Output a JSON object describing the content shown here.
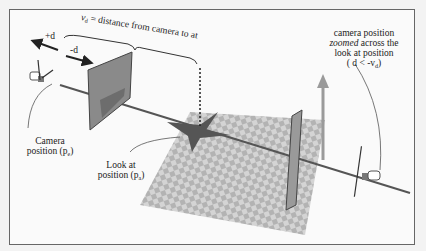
{
  "labels": {
    "distance_vd": "v",
    "distance_sub": "d",
    "distance_text": " = distance from camera to at",
    "plus_d": "+d",
    "minus_d": "-d",
    "camera_position_line1": "Camera",
    "camera_position_line2": "position (p",
    "camera_position_sub": "e",
    "look_at_line1": "Look at",
    "look_at_line2": "position (p",
    "look_at_sub": "a",
    "zoomed_line1": "camera position",
    "zoomed_line2_em": "zoomed",
    "zoomed_line2_rest": " across the",
    "zoomed_line3": "look at position",
    "zoomed_line4_pre": "( d < -v",
    "zoomed_line4_sub": "d",
    "close_paren": ")"
  },
  "colors": {
    "checker_light": "#d4d4d4",
    "checker_dark": "#b3b3b3",
    "axis_line": "#555555",
    "up_arrow": "#9a9a9a"
  }
}
